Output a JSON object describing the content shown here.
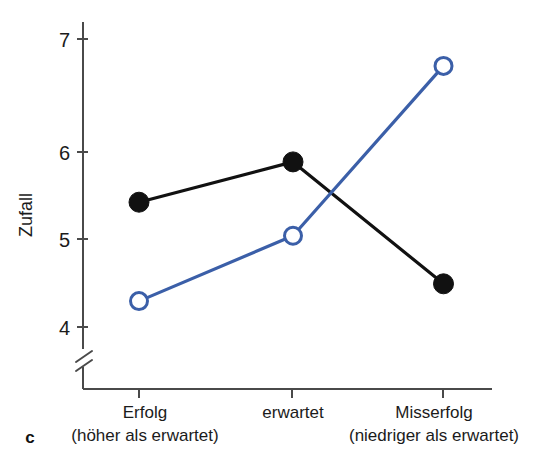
{
  "chart_data": {
    "type": "line",
    "title": "",
    "panel_letter": "c",
    "xlabel": "",
    "ylabel": "Zufall",
    "categories": [
      "Erfolg",
      "erwartet",
      "Misserfolg"
    ],
    "category_sublabels": [
      "(höher als erwartet)",
      "",
      "(niedriger als erwartet)"
    ],
    "ytick_labels": [
      "7",
      "6",
      "5",
      "4"
    ],
    "yticks": [
      7,
      6,
      5,
      4
    ],
    "ylim": [
      3.85,
      7.15
    ],
    "y_axis_break": true,
    "grid": false,
    "legend_position": "none",
    "series": [
      {
        "name": "schwarz",
        "marker": "filled-circle",
        "color": "#111111",
        "values": [
          5.3,
          5.72,
          4.45
        ]
      },
      {
        "name": "blau",
        "marker": "open-circle",
        "color": "#3b5fa8",
        "values": [
          4.27,
          4.95,
          6.72
        ]
      }
    ]
  },
  "figure": {
    "panel_letter": "c",
    "y_axis_title": "Zufall",
    "y_tick_7": "7",
    "y_tick_6": "6",
    "y_tick_5": "5",
    "y_tick_4": "4",
    "x_cat_1_main": "Erfolg",
    "x_cat_1_sub": "(höher als erwartet)",
    "x_cat_2_main": "erwartet",
    "x_cat_2_sub": "",
    "x_cat_3_main": "Misserfolg",
    "x_cat_3_sub": "(niedriger als erwartet)"
  },
  "colors": {
    "series_black": "#111111",
    "series_blue": "#3b5fa8",
    "axis": "#4a4a4a",
    "background": "#ffffff",
    "text": "#1b1b1b"
  }
}
